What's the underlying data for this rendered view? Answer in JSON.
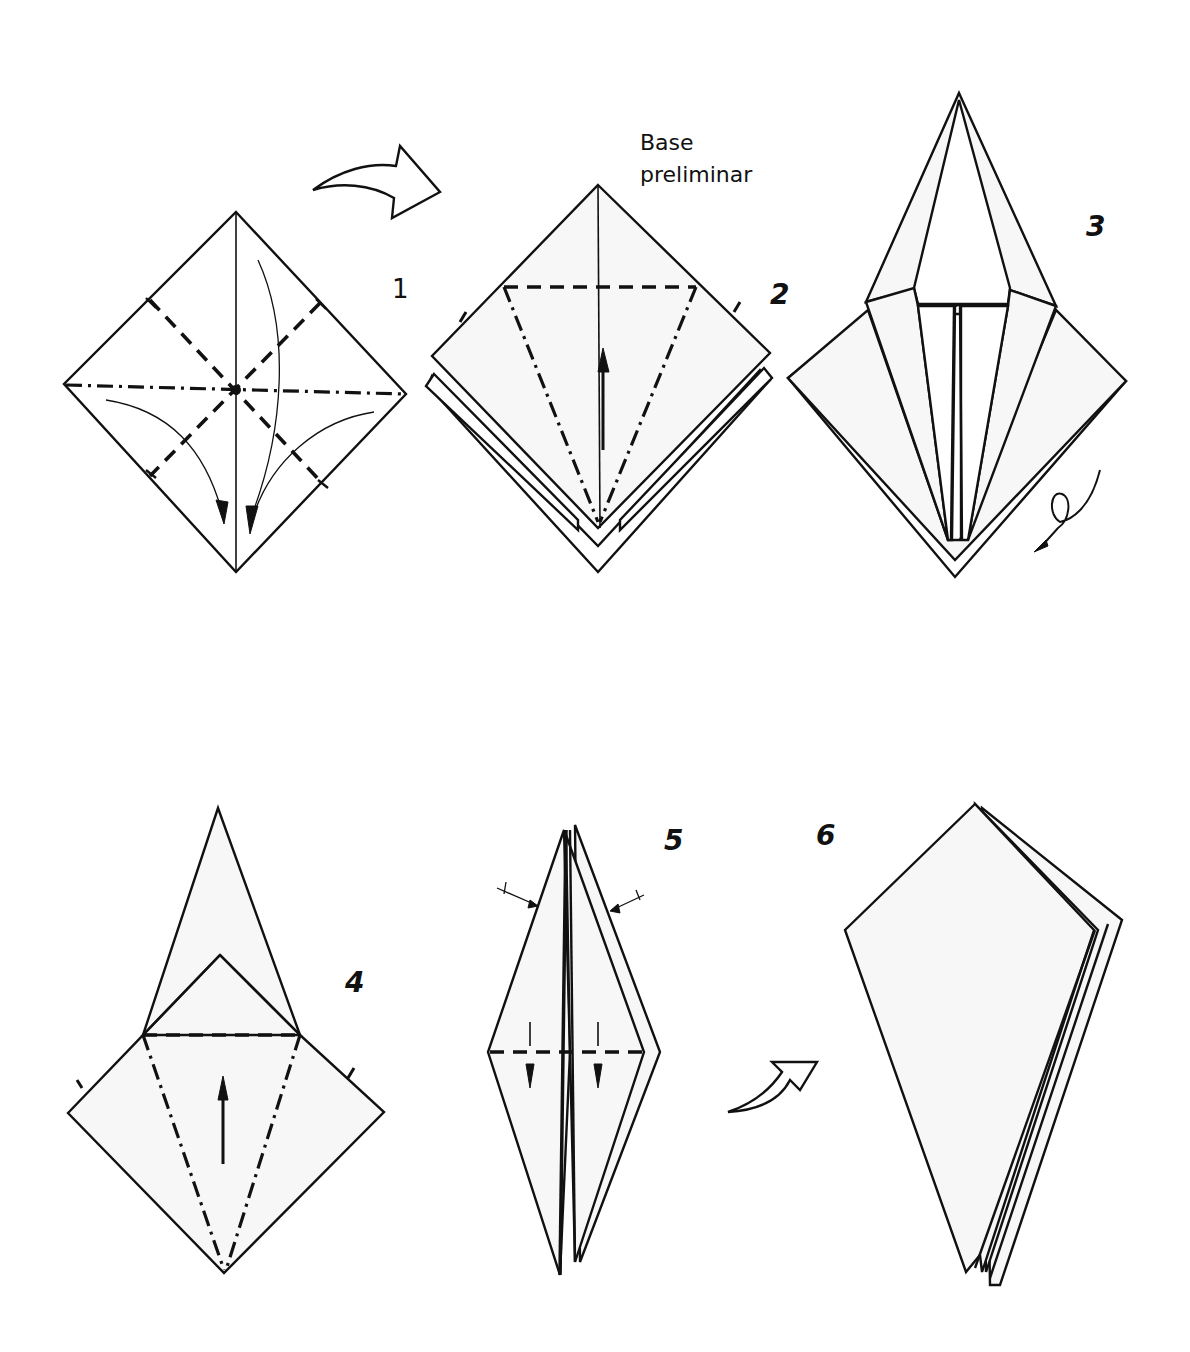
{
  "diagram": {
    "caption": {
      "line1": "Base",
      "line2": "preliminar"
    },
    "steps": [
      {
        "number": "1",
        "description": "Square with valley and mountain creases; fold corners toward bottom"
      },
      {
        "number": "2",
        "description": "Base preliminar; petal fold lines shown"
      },
      {
        "number": "3",
        "description": "Flaps folded to center; turn over"
      },
      {
        "number": "4",
        "description": "Repeat petal fold on the other side"
      },
      {
        "number": "5",
        "description": "Narrow edges to center; fold down"
      },
      {
        "number": "6",
        "description": "Resulting kite shape"
      }
    ],
    "symbols": {
      "turn_over_arrow": "turn-over-icon",
      "flip_loop_arrow": "flip-loop-icon",
      "rotate_arrow": "rotate-arrow-icon"
    },
    "colors": {
      "line": "#111111",
      "paper": "#f7f7f7",
      "background": "#ffffff"
    }
  }
}
